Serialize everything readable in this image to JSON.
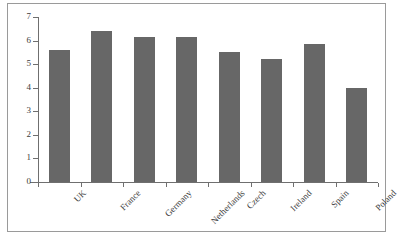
{
  "chart_data": {
    "type": "bar",
    "title": "",
    "subtitle": "",
    "xlabel": "",
    "ylabel": "",
    "categories": [
      "UK",
      "France",
      "Germany",
      "Netherlands",
      "Czech",
      "Ireland",
      "Spain",
      "Poland"
    ],
    "values": [
      5.6,
      6.4,
      6.15,
      6.15,
      5.5,
      5.2,
      5.85,
      4.0
    ],
    "ylim": [
      0,
      7
    ],
    "ytick_labels": [
      "0",
      "1",
      "2",
      "3",
      "4",
      "5",
      "6",
      "7"
    ],
    "ytick_values": [
      0,
      1,
      2,
      3,
      4,
      5,
      6,
      7
    ],
    "grid": false,
    "legend": null,
    "legend_position": "none",
    "annotations": [],
    "series": [
      {
        "name": "",
        "values": [
          5.6,
          6.4,
          6.15,
          6.15,
          5.5,
          5.2,
          5.85,
          4.0
        ]
      }
    ],
    "bar_color": "#676767",
    "axis_color": "#6f6f6f",
    "frame_color": "#9a9a9a",
    "background_color": "#ffffff",
    "xtick_label_rotation": -45
  }
}
